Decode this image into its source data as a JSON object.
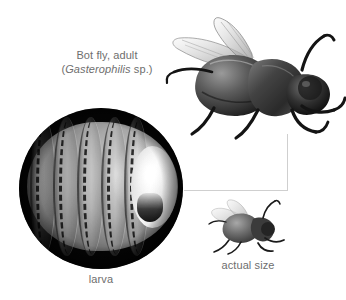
{
  "figure": {
    "background_color": "#ffffff",
    "text_color": "#6e6e6e",
    "leader_line_color": "#cfcfcf",
    "width": 346,
    "height": 300
  },
  "labels": {
    "adult_line1": "Bot fly, adult",
    "adult_open_paren": "(",
    "adult_genus": "Gasterophilis",
    "adult_species_suffix": " sp.)",
    "larva": "larva",
    "actual_size": "actual size"
  },
  "images": {
    "adult_fly": "adult-bot-fly-photo",
    "larva": "larva-micrograph-photo",
    "small_fly": "actual-size-fly-photo"
  }
}
